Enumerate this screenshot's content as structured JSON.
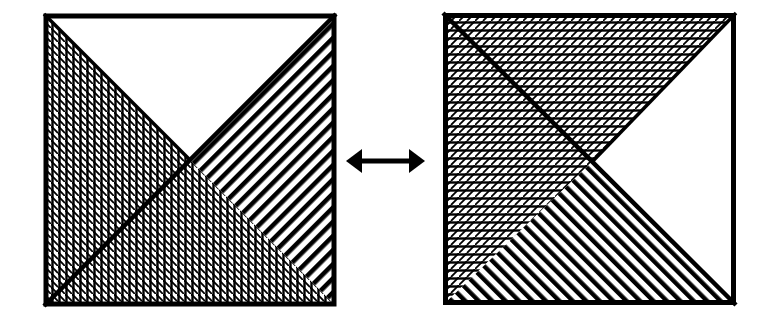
{
  "diagram": {
    "colors": {
      "ink": "#000000",
      "paper": "#ffffff"
    },
    "left_square": {
      "x": 44,
      "y": 14,
      "size": 292,
      "regions": {
        "top": "blank",
        "left": "crosshatch-vertical-diagonal",
        "bottom": "crosshatch-vertical-diagonal",
        "right": "stripes-descending"
      }
    },
    "arrow": {
      "icon": "double-headed-arrow-icon",
      "x1": 346,
      "x2": 425,
      "y": 161
    },
    "right_square": {
      "x": 443,
      "y": 13,
      "size": 293,
      "regions": {
        "top": "crosshatch-horizontal-diagonal",
        "left": "crosshatch-horizontal-diagonal",
        "bottom": "stripes-ascending",
        "right": "blank"
      }
    }
  }
}
